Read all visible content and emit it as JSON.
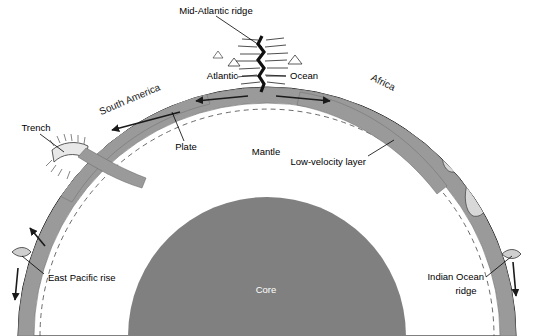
{
  "figure": {
    "type": "earth-cross-section",
    "width": 533,
    "height": 336,
    "background": "#ffffff"
  },
  "colors": {
    "background": "#ffffff",
    "mantle": "#ffffff",
    "core": "#808080",
    "plate": "#9a9a9a",
    "continent": "#d8d8d8",
    "outline": "#000000",
    "label": "#000000",
    "core_label": "#ffffff"
  },
  "labels": {
    "mid_atlantic_ridge": "Mid-Atlantic ridge",
    "atlantic": "Atlantic",
    "ocean": "Ocean",
    "africa": "Africa",
    "south_america": "South America",
    "trench": "Trench",
    "plate": "Plate",
    "mantle": "Mantle",
    "low_velocity_layer": "Low-velocity layer",
    "east_pacific_rise": "East Pacific rise",
    "indian_ocean_line1": "Indian Ocean",
    "indian_ocean_line2": "ridge",
    "core": "Core"
  },
  "structure": {
    "layers": [
      {
        "name": "Core",
        "fill": "#808080",
        "label_shown": true
      },
      {
        "name": "Mantle",
        "fill": "#ffffff",
        "label_shown": true
      },
      {
        "name": "Low-velocity layer",
        "style": "dashed-arc",
        "label_shown": true
      },
      {
        "name": "Plate",
        "fill": "#9a9a9a",
        "label_shown": true
      }
    ],
    "features": [
      {
        "name": "Mid-Atlantic ridge",
        "kind": "spreading-ridge",
        "position": "top-center"
      },
      {
        "name": "East Pacific rise",
        "kind": "spreading-ridge",
        "position": "left-limb"
      },
      {
        "name": "Indian Ocean ridge",
        "kind": "spreading-ridge",
        "position": "right-limb"
      },
      {
        "name": "Trench",
        "kind": "subduction-zone",
        "position": "left-upper"
      }
    ],
    "continents": [
      {
        "name": "South America",
        "position": "upper-left"
      },
      {
        "name": "Africa",
        "position": "upper-right"
      }
    ],
    "motion_arrows": [
      {
        "direction": "left",
        "location": "plate-left-of-ridge"
      },
      {
        "direction": "right",
        "location": "plate-right-of-ridge"
      },
      {
        "direction": "left-descending",
        "location": "toward-trench"
      },
      {
        "direction": "up",
        "location": "east-pacific-rise"
      },
      {
        "direction": "down",
        "location": "left-limb-lower"
      },
      {
        "direction": "down",
        "location": "indian-ocean-ridge"
      }
    ]
  }
}
